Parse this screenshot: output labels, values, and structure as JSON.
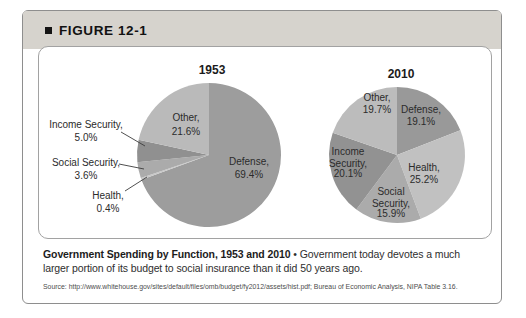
{
  "figure": {
    "label": "FIGURE 12-1"
  },
  "caption": {
    "bold": "Government Spending by Function, 1953 and 2010",
    "text": "• Government today devotes a much larger portion of its budget to social insurance than it did 50 years ago."
  },
  "source": "Source: http://www.whitehouse.gov/sites/default/files/omb/budget/fy2012/assets/hist.pdf; Bureau of Economic Analysis, NIPA Table 3.16.",
  "chart_data": [
    {
      "type": "pie",
      "title": "1953",
      "categories": [
        "Defense",
        "Health",
        "Social Security",
        "Income Security",
        "Other"
      ],
      "values": [
        69.4,
        0.4,
        3.6,
        5.0,
        21.6
      ],
      "slice_labels": [
        "Defense,\n69.4%",
        "Health,\n0.4%",
        "Social Security,\n3.6%",
        "Income Security,\n5.0%",
        "Other,\n21.6%"
      ],
      "colors": [
        "#9d9d9d",
        "#c8c8c8",
        "#ababab",
        "#909090",
        "#bababa"
      ],
      "start_angle_deg": 0,
      "direction": "clockwise-from-top",
      "legend": "none"
    },
    {
      "type": "pie",
      "title": "2010",
      "categories": [
        "Defense",
        "Health",
        "Social Security",
        "Income Security",
        "Other"
      ],
      "values": [
        19.1,
        25.2,
        15.9,
        20.1,
        19.7
      ],
      "slice_labels": [
        "Defense,\n19.1%",
        "Health,\n25.2%",
        "Social\nSecurity,\n15.9%",
        "Income\nSecurity,\n20.1%",
        "Other,\n19.7%"
      ],
      "colors": [
        "#999999",
        "#c1c1c1",
        "#ababab",
        "#929292",
        "#bcbcbc"
      ],
      "start_angle_deg": 0,
      "direction": "clockwise-from-top",
      "legend": "none"
    }
  ]
}
